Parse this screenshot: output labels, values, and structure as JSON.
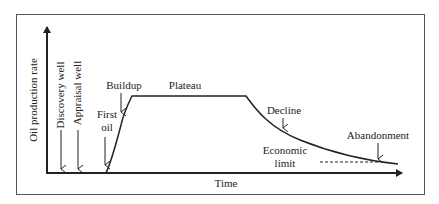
{
  "diagram": {
    "type": "oil-field-production-profile",
    "axes": {
      "y_label": "Oil production rate",
      "x_label": "Time"
    },
    "phases": {
      "discovery_well": "Discovery well",
      "appraisal_well": "Appraisal well",
      "first_oil_line1": "First",
      "first_oil_line2": "oil",
      "buildup": "Buildup",
      "plateau": "Plateau",
      "decline": "Decline",
      "economic_limit_line1": "Economic",
      "economic_limit_line2": "limit",
      "abandonment": "Abandonment"
    },
    "colors": {
      "line": "#222222",
      "frame": "#555555",
      "background": "#ffffff"
    }
  }
}
